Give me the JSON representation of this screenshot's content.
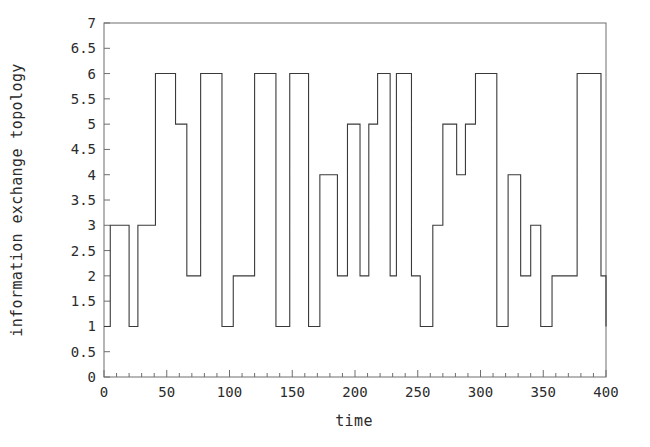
{
  "chart_data": {
    "type": "line",
    "line_style": "step-post",
    "title": "",
    "subtitle": "",
    "xlabel": "time",
    "ylabel": "information exchange topology",
    "xlim": [
      0,
      400
    ],
    "ylim": [
      0,
      7
    ],
    "grid": false,
    "legend": null,
    "legend_position": "none",
    "x_major_ticks": [
      0,
      50,
      100,
      150,
      200,
      250,
      300,
      350,
      400
    ],
    "x_major_tick_labels": [
      "0",
      "50",
      "100",
      "150",
      "200",
      "250",
      "300",
      "350",
      "400"
    ],
    "x_minor_tick_interval": 10,
    "y_major_ticks": [
      0,
      0.5,
      1,
      1.5,
      2,
      2.5,
      3,
      3.5,
      4,
      4.5,
      5,
      5.5,
      6,
      6.5,
      7
    ],
    "y_major_tick_labels": [
      "0",
      "0.5",
      "1",
      "1.5",
      "2",
      "2.5",
      "3",
      "3.5",
      "4",
      "4.5",
      "5",
      "5.5",
      "6",
      "6.5",
      "7"
    ],
    "line_color": "#3a3a3a",
    "line_width": 1.1,
    "axis_color": "#6e6e6e",
    "background_color": "#ffffff",
    "series": [
      {
        "name": "information exchange topology",
        "x": [
          0,
          5,
          13,
          20,
          27,
          34,
          41,
          48,
          63,
          71,
          80,
          93,
          100,
          116,
          124,
          139,
          146,
          155,
          164,
          171,
          181,
          190,
          198,
          206,
          213,
          223,
          230,
          238,
          246,
          254,
          262,
          270,
          280,
          288,
          296,
          304,
          312,
          320,
          330,
          338,
          346,
          354,
          362,
          370,
          378,
          386,
          394,
          400
        ],
        "y": [
          1,
          3,
          3,
          1,
          1,
          3,
          3,
          6,
          5,
          2,
          6,
          6,
          2,
          2,
          6,
          6,
          1,
          6,
          1,
          4,
          4,
          2,
          5,
          5,
          2,
          6,
          2,
          6,
          6,
          2,
          1,
          1,
          3,
          5,
          4,
          4,
          5,
          6,
          1,
          1,
          4,
          2,
          3,
          2,
          1,
          2,
          6,
          2
        ],
        "steps": [
          {
            "t_start": 0,
            "t_end": 5,
            "value": 1
          },
          {
            "t_start": 5,
            "t_end": 20,
            "value": 3
          },
          {
            "t_start": 20,
            "t_end": 27,
            "value": 1
          },
          {
            "t_start": 27,
            "t_end": 41,
            "value": 3
          },
          {
            "t_start": 41,
            "t_end": 57,
            "value": 6
          },
          {
            "t_start": 57,
            "t_end": 66,
            "value": 5
          },
          {
            "t_start": 66,
            "t_end": 77,
            "value": 2
          },
          {
            "t_start": 77,
            "t_end": 94,
            "value": 6
          },
          {
            "t_start": 94,
            "t_end": 103,
            "value": 1
          },
          {
            "t_start": 103,
            "t_end": 120,
            "value": 2
          },
          {
            "t_start": 120,
            "t_end": 137,
            "value": 6
          },
          {
            "t_start": 137,
            "t_end": 148,
            "value": 1
          },
          {
            "t_start": 148,
            "t_end": 163,
            "value": 6
          },
          {
            "t_start": 163,
            "t_end": 172,
            "value": 1
          },
          {
            "t_start": 172,
            "t_end": 186,
            "value": 4
          },
          {
            "t_start": 186,
            "t_end": 194,
            "value": 2
          },
          {
            "t_start": 194,
            "t_end": 204,
            "value": 5
          },
          {
            "t_start": 204,
            "t_end": 211,
            "value": 2
          },
          {
            "t_start": 211,
            "t_end": 218,
            "value": 5
          },
          {
            "t_start": 218,
            "t_end": 228,
            "value": 6
          },
          {
            "t_start": 228,
            "t_end": 233,
            "value": 2
          },
          {
            "t_start": 233,
            "t_end": 245,
            "value": 6
          },
          {
            "t_start": 245,
            "t_end": 252,
            "value": 2
          },
          {
            "t_start": 252,
            "t_end": 262,
            "value": 1
          },
          {
            "t_start": 262,
            "t_end": 270,
            "value": 3
          },
          {
            "t_start": 270,
            "t_end": 281,
            "value": 5
          },
          {
            "t_start": 281,
            "t_end": 288,
            "value": 4
          },
          {
            "t_start": 288,
            "t_end": 296,
            "value": 5
          },
          {
            "t_start": 296,
            "t_end": 313,
            "value": 6
          },
          {
            "t_start": 313,
            "t_end": 322,
            "value": 1
          },
          {
            "t_start": 322,
            "t_end": 332,
            "value": 4
          },
          {
            "t_start": 332,
            "t_end": 340,
            "value": 2
          },
          {
            "t_start": 340,
            "t_end": 348,
            "value": 3
          },
          {
            "t_start": 348,
            "t_end": 357,
            "value": 1
          },
          {
            "t_start": 357,
            "t_end": 377,
            "value": 2
          },
          {
            "t_start": 377,
            "t_end": 396,
            "value": 6
          },
          {
            "t_start": 396,
            "t_end": 400,
            "value": 2
          }
        ]
      }
    ]
  }
}
